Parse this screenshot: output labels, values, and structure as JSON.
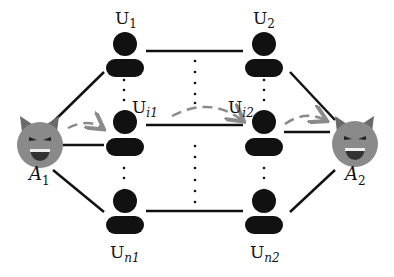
{
  "diagram": {
    "attackers": [
      {
        "id": "A1",
        "base": "A",
        "sub": "1"
      },
      {
        "id": "A2",
        "base": "A",
        "sub": "2"
      }
    ],
    "users_left": [
      {
        "id": "U1",
        "base": "U",
        "sub": "1"
      },
      {
        "id": "Ui1",
        "base": "U",
        "sub": "i1"
      },
      {
        "id": "Un1",
        "base": "U",
        "sub": "n1"
      }
    ],
    "users_right": [
      {
        "id": "U2",
        "base": "U",
        "sub": "2"
      },
      {
        "id": "Ui2",
        "base": "U",
        "sub": "i2"
      },
      {
        "id": "Un2",
        "base": "U",
        "sub": "n2"
      }
    ],
    "colors": {
      "attacker": "#8a8a8a",
      "user": "#111111",
      "edge": "#111111",
      "dashed_arrow": "#8a8a8a"
    }
  }
}
